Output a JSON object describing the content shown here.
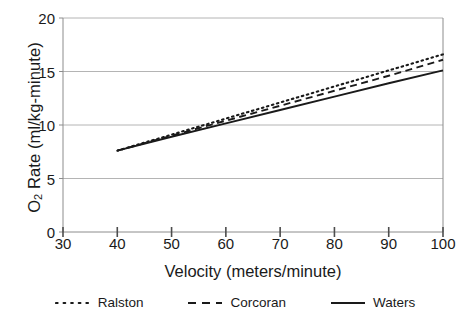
{
  "chart_data": {
    "type": "line",
    "title": "",
    "xlabel": "Velocity  (meters/minute)",
    "ylabel_text": "O Rate  (ml/kg-minute)",
    "ylabel_prefix": "O",
    "ylabel_sub": "2",
    "ylabel_suffix": " Rate  (ml/kg-minute)",
    "xlim": [
      30,
      100
    ],
    "ylim": [
      0,
      20
    ],
    "xticks": [
      "30",
      "40",
      "50",
      "60",
      "70",
      "80",
      "90",
      "100"
    ],
    "xtick_values": [
      30,
      40,
      50,
      60,
      70,
      80,
      90,
      100
    ],
    "yticks": [
      "0",
      "5",
      "10",
      "15",
      "20"
    ],
    "ytick_values": [
      0,
      5,
      10,
      15,
      20
    ],
    "grid": "horizontal",
    "legend_position": "below",
    "x": [
      40,
      50,
      60,
      70,
      80,
      90,
      100
    ],
    "series": [
      {
        "name": "Ralston",
        "style": "dotted",
        "color": "#1a1a1a",
        "values": [
          7.6,
          9.1,
          10.6,
          12.1,
          13.6,
          15.1,
          16.6
        ]
      },
      {
        "name": "Corcoran",
        "style": "dashed",
        "color": "#1a1a1a",
        "values": [
          7.6,
          9.0,
          10.4,
          11.8,
          13.2,
          14.6,
          16.1
        ]
      },
      {
        "name": "Waters",
        "style": "solid",
        "color": "#1a1a1a",
        "values": [
          7.6,
          8.9,
          10.15,
          11.4,
          12.65,
          13.9,
          15.1
        ]
      }
    ]
  },
  "legend": {
    "items": [
      {
        "label": "Ralston"
      },
      {
        "label": "Corcoran"
      },
      {
        "label": "Waters"
      }
    ]
  },
  "axes": {
    "x_title": "Velocity  (meters/minute)",
    "y_title_prefix": "O",
    "y_title_sub": "2",
    "y_title_suffix": " Rate  (ml/kg-minute)"
  },
  "colors": {
    "ink": "#1a1a1a",
    "grid": "#b4b4b4",
    "axis": "#8c8c8c",
    "background": "#ffffff"
  }
}
